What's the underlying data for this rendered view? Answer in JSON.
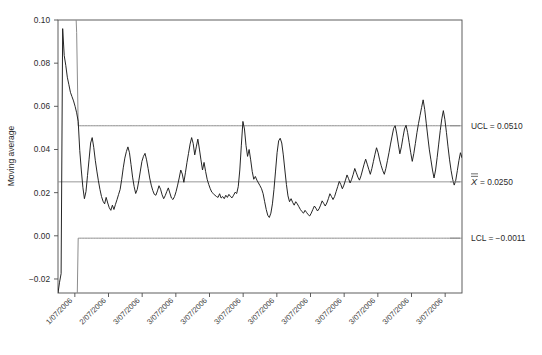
{
  "chart_data": {
    "type": "line",
    "title": "",
    "subtitle": "",
    "xlabel": "",
    "ylabel": "Moving average",
    "grid": false,
    "legend_position": "right-outside",
    "ylim": [
      -0.0265,
      0.1
    ],
    "ytick_labels": [
      "0.10",
      "0.08",
      "0.06",
      "0.04",
      "0.02",
      "0.00",
      "-0.02"
    ],
    "ytick_values": [
      0.1,
      0.08,
      0.06,
      0.04,
      0.02,
      0.0,
      -0.02
    ],
    "xtick_labels": [
      "1/07/2006",
      "2/07/2006",
      "3/07/2006",
      "3/07/2006",
      "3/07/2006",
      "3/07/2006",
      "3/07/2006",
      "3/07/2006",
      "3/07/2006",
      "3/07/2006",
      "3/07/2006",
      "3/07/2006"
    ],
    "annotations": [
      {
        "name": "ucl",
        "label": "UCL = 0.0510",
        "value": 0.051
      },
      {
        "name": "centerline",
        "label_prefix": "X",
        "label_suffix": " = 0.0250",
        "value": 0.025
      },
      {
        "name": "lcl",
        "label": "LCL = −0.0011",
        "value": -0.0011
      }
    ],
    "control_limits": {
      "ucl": 0.051,
      "center": 0.025,
      "lcl": -0.0011
    },
    "colors": {
      "series": "#1a1a1a",
      "limit_line": "#8c8c8c",
      "center_line": "#8c8c8c",
      "axis": "#4d4d4d",
      "text": "#2b2b2b",
      "background": "#ffffff"
    },
    "series": [
      {
        "name": "Moving average",
        "values": [
          -0.0265,
          -0.0215,
          -0.0175,
          0.096,
          0.0835,
          0.079,
          0.0735,
          0.07,
          0.0665,
          0.0645,
          0.0625,
          0.06,
          0.057,
          0.053,
          0.0395,
          0.0305,
          0.0225,
          0.0172,
          0.0205,
          0.028,
          0.0355,
          0.043,
          0.0455,
          0.041,
          0.035,
          0.03,
          0.0255,
          0.0215,
          0.0182,
          0.016,
          0.0148,
          0.0178,
          0.0152,
          0.013,
          0.0118,
          0.0142,
          0.0122,
          0.0146,
          0.0168,
          0.0192,
          0.0215,
          0.0262,
          0.0315,
          0.036,
          0.039,
          0.0412,
          0.0385,
          0.033,
          0.0272,
          0.0228,
          0.0196,
          0.0215,
          0.0255,
          0.03,
          0.0345,
          0.0368,
          0.0382,
          0.0352,
          0.0312,
          0.0268,
          0.0235,
          0.021,
          0.0192,
          0.0188,
          0.0208,
          0.0232,
          0.0216,
          0.019,
          0.0172,
          0.0186,
          0.0205,
          0.0222,
          0.0198,
          0.0175,
          0.0168,
          0.0182,
          0.0205,
          0.0235,
          0.0268,
          0.0305,
          0.0286,
          0.0248,
          0.0292,
          0.034,
          0.0382,
          0.0425,
          0.0455,
          0.0428,
          0.0375,
          0.0412,
          0.0448,
          0.0402,
          0.0352,
          0.0305,
          0.034,
          0.0298,
          0.0262,
          0.0238,
          0.0218,
          0.0202,
          0.0195,
          0.0188,
          0.0182,
          0.0178,
          0.0195,
          0.0175,
          0.0182,
          0.0172,
          0.0188,
          0.0178,
          0.0192,
          0.0182,
          0.0176,
          0.0188,
          0.0202,
          0.0196,
          0.0228,
          0.0305,
          0.042,
          0.053,
          0.0495,
          0.0418,
          0.0368,
          0.04,
          0.0352,
          0.0298,
          0.0262,
          0.0275,
          0.0258,
          0.0245,
          0.0232,
          0.0218,
          0.0195,
          0.0158,
          0.0122,
          0.0095,
          0.0085,
          0.0105,
          0.0148,
          0.0215,
          0.03,
          0.0385,
          0.044,
          0.0452,
          0.043,
          0.0375,
          0.0305,
          0.0238,
          0.0185,
          0.0158,
          0.0172,
          0.0155,
          0.0142,
          0.0158,
          0.0148,
          0.0135,
          0.0122,
          0.0112,
          0.0105,
          0.0118,
          0.0108,
          0.0098,
          0.0092,
          0.0105,
          0.0122,
          0.0138,
          0.0128,
          0.0115,
          0.0125,
          0.0142,
          0.0162,
          0.015,
          0.0138,
          0.0152,
          0.0172,
          0.0195,
          0.0182,
          0.0168,
          0.0182,
          0.0205,
          0.0228,
          0.0252,
          0.0238,
          0.0218,
          0.0235,
          0.0258,
          0.0282,
          0.0265,
          0.0245,
          0.0262,
          0.0285,
          0.0312,
          0.0292,
          0.0272,
          0.0258,
          0.0278,
          0.0305,
          0.0332,
          0.0355,
          0.0332,
          0.0308,
          0.0285,
          0.0312,
          0.0345,
          0.0378,
          0.0408,
          0.0385,
          0.0352,
          0.0325,
          0.0302,
          0.0285,
          0.0312,
          0.0348,
          0.0385,
          0.0425,
          0.0462,
          0.0498,
          0.051,
          0.0472,
          0.0425,
          0.038,
          0.0412,
          0.0455,
          0.0495,
          0.0512,
          0.0478,
          0.0432,
          0.0385,
          0.0345,
          0.0382,
          0.0428,
          0.0478,
          0.052,
          0.0558,
          0.0595,
          0.063,
          0.0585,
          0.0522,
          0.0458,
          0.0398,
          0.0352,
          0.0305,
          0.0268,
          0.0305,
          0.0362,
          0.0425,
          0.0488,
          0.0542,
          0.058,
          0.0538,
          0.0478,
          0.0412,
          0.0352,
          0.0302,
          0.0262,
          0.0235,
          0.0258,
          0.0302,
          0.0348,
          0.0385,
          0.0362
        ]
      }
    ],
    "limit_curve_note": "UCL and LCL converge from the plot edges over the first ~13 points, then remain constant."
  }
}
